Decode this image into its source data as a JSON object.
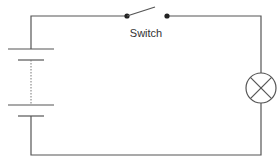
{
  "diagram": {
    "type": "circuit",
    "labels": {
      "switch": "Switch"
    },
    "components": [
      {
        "name": "battery",
        "cells": 2,
        "symbol": "battery-cells-with-dashed-link"
      },
      {
        "name": "switch",
        "state": "open",
        "symbol": "open-switch"
      },
      {
        "name": "lamp",
        "symbol": "circle-with-cross"
      }
    ],
    "colors": {
      "wire": "#555555",
      "background": "#ffffff",
      "text": "#333333"
    }
  }
}
